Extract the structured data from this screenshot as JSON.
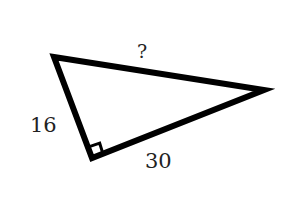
{
  "diagram": {
    "type": "right-triangle",
    "stroke_color": "#000000",
    "background_color": "#ffffff",
    "vertices": {
      "top_left": [
        54,
        57
      ],
      "right": [
        264,
        90
      ],
      "right_angle": [
        92,
        158
      ]
    },
    "right_angle_marker": "right_angle",
    "sides": {
      "hypotenuse": {
        "label": "?"
      },
      "leg_left": {
        "label": "16"
      },
      "leg_bottom": {
        "label": "30"
      }
    }
  }
}
